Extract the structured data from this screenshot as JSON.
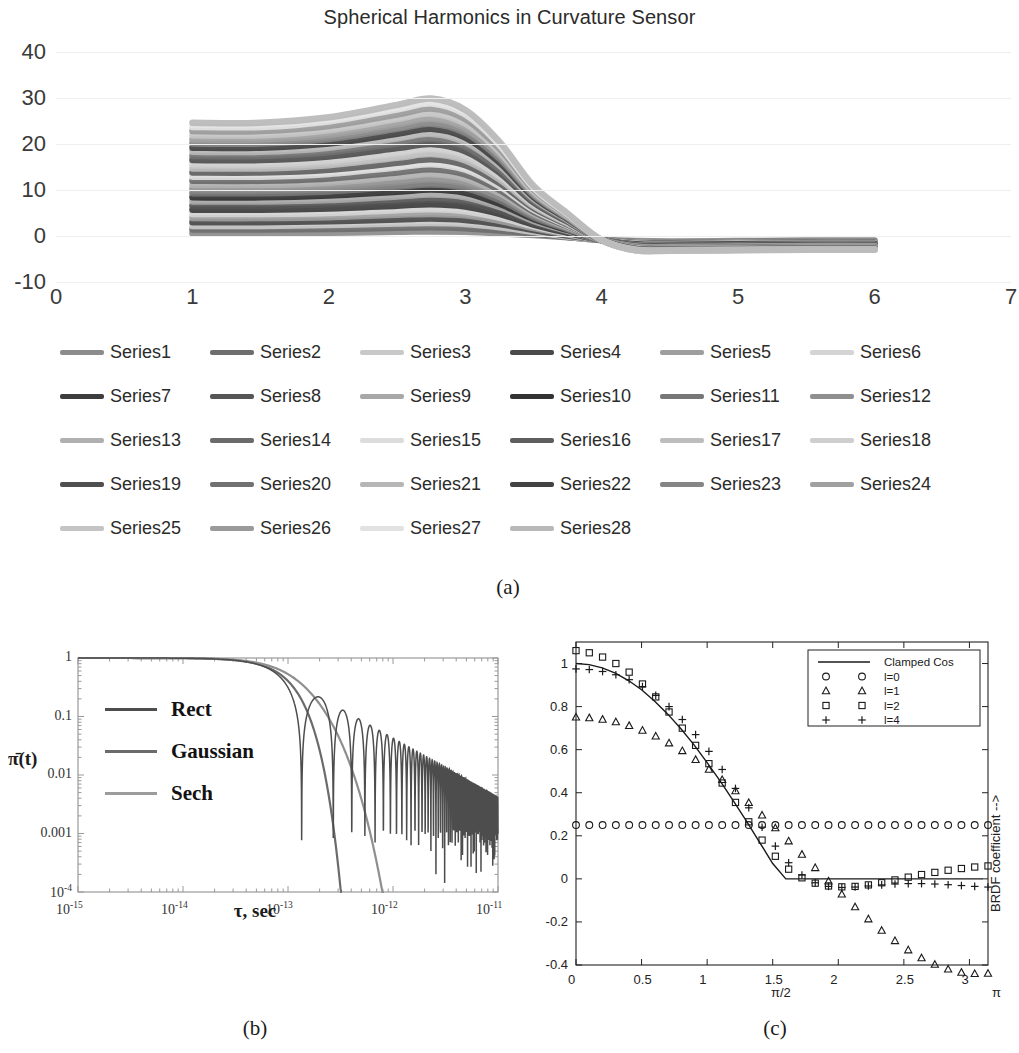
{
  "figure": {
    "captions": {
      "a": "(a)",
      "b": "(b)",
      "c": "(c)"
    }
  },
  "panel_a": {
    "title": "Spherical Harmonics in Curvature Sensor"
  },
  "panel_b": {
    "ylabel": "π̄(t)",
    "xlabel": "τ, sec",
    "legend": [
      "Rect",
      "Gaussian",
      "Sech"
    ],
    "yticks": [
      "1",
      "0.1",
      "0.01",
      "0.001",
      "10⁻⁴"
    ],
    "xticks": [
      "10⁻¹⁵",
      "10⁻¹⁴",
      "10⁻¹³",
      "10⁻¹²",
      "10⁻¹¹"
    ]
  },
  "panel_c": {
    "right_label": "BRDF coefficient -->",
    "legend": [
      "Clamped Cos",
      "l=0",
      "l=1",
      "l=2",
      "l=4"
    ],
    "xticks": [
      "0",
      "0.5",
      "1",
      "1.5",
      "2",
      "2.5",
      "3"
    ],
    "yticks": [
      "1",
      "0.8",
      "0.6",
      "0.4",
      "0.2",
      "0",
      "-0.2",
      "-0.4"
    ],
    "annotations": {
      "half_pi": "π/2",
      "pi": "π"
    }
  },
  "chart_data": [
    {
      "id": "a",
      "type": "line",
      "title": "Spherical Harmonics in Curvature Sensor",
      "xlabel": "",
      "ylabel": "",
      "xlim": [
        0,
        7
      ],
      "ylim": [
        -10,
        40
      ],
      "xticks": [
        0,
        1,
        2,
        3,
        4,
        5,
        6,
        7
      ],
      "yticks": [
        -10,
        0,
        10,
        20,
        30,
        40
      ],
      "grid": true,
      "legend_position": "bottom",
      "x": [
        1,
        1.5,
        2,
        2.5,
        2.75,
        3,
        3.25,
        3.5,
        3.75,
        4,
        4.25,
        4.5,
        5,
        5.5,
        6
      ],
      "series": [
        {
          "name": "Series1",
          "color": "#8c8c8c",
          "values": [
            0.6,
            0.6,
            0.7,
            0.9,
            1.0,
            0.9,
            0.6,
            0.2,
            -0.3,
            -0.8,
            -1.1,
            -1.2,
            -1.1,
            -1.0,
            -1.0
          ]
        },
        {
          "name": "Series2",
          "color": "#6e6e6e",
          "values": [
            1.4,
            1.4,
            1.5,
            1.8,
            1.9,
            1.7,
            1.2,
            0.5,
            -0.2,
            -0.9,
            -1.3,
            -1.4,
            -1.3,
            -1.2,
            -1.2
          ]
        },
        {
          "name": "Series3",
          "color": "#c9c9c9",
          "values": [
            2.2,
            2.2,
            2.4,
            2.7,
            2.8,
            2.6,
            1.9,
            0.9,
            -0.1,
            -0.9,
            -1.4,
            -1.5,
            -1.4,
            -1.3,
            -1.3
          ]
        },
        {
          "name": "Series4",
          "color": "#4a4a4a",
          "values": [
            3.0,
            3.0,
            3.2,
            3.6,
            3.8,
            3.5,
            2.6,
            1.3,
            0.1,
            -0.9,
            -1.5,
            -1.6,
            -1.5,
            -1.4,
            -1.4
          ]
        },
        {
          "name": "Series5",
          "color": "#9e9e9e",
          "values": [
            3.9,
            3.9,
            4.1,
            4.6,
            4.8,
            4.5,
            3.3,
            1.7,
            0.3,
            -0.9,
            -1.6,
            -1.7,
            -1.6,
            -1.5,
            -1.5
          ]
        },
        {
          "name": "Series6",
          "color": "#d4d4d4",
          "values": [
            4.8,
            4.8,
            5.0,
            5.6,
            5.8,
            5.4,
            4.0,
            2.1,
            0.5,
            -0.9,
            -1.7,
            -1.8,
            -1.7,
            -1.6,
            -1.6
          ]
        },
        {
          "name": "Series7",
          "color": "#3d3d3d",
          "values": [
            5.7,
            5.7,
            6.0,
            6.6,
            6.9,
            6.4,
            4.8,
            2.5,
            0.7,
            -0.9,
            -1.8,
            -1.9,
            -1.8,
            -1.7,
            -1.7
          ]
        },
        {
          "name": "Series8",
          "color": "#555555",
          "values": [
            6.6,
            6.6,
            6.9,
            7.6,
            7.9,
            7.4,
            5.5,
            2.9,
            0.9,
            -0.9,
            -1.9,
            -2.0,
            -1.9,
            -1.8,
            -1.8
          ]
        },
        {
          "name": "Series9",
          "color": "#a8a8a8",
          "values": [
            7.5,
            7.5,
            7.8,
            8.6,
            9.0,
            8.4,
            6.3,
            3.3,
            1.1,
            -0.9,
            -2.0,
            -2.1,
            -2.0,
            -1.9,
            -1.9
          ]
        },
        {
          "name": "Series10",
          "color": "#333333",
          "values": [
            8.4,
            8.4,
            8.8,
            9.6,
            10.1,
            9.4,
            7.0,
            3.7,
            1.3,
            -0.9,
            -2.1,
            -2.2,
            -2.1,
            -2.0,
            -2.0
          ]
        },
        {
          "name": "Series11",
          "color": "#777777",
          "values": [
            9.3,
            9.3,
            9.7,
            10.7,
            11.2,
            10.4,
            7.8,
            4.1,
            1.5,
            -0.9,
            -2.2,
            -2.3,
            -2.2,
            -2.1,
            -2.1
          ]
        },
        {
          "name": "Series12",
          "color": "#8f8f8f",
          "values": [
            10.2,
            10.2,
            10.6,
            11.7,
            12.3,
            11.4,
            8.5,
            4.5,
            1.7,
            -0.9,
            -2.3,
            -2.4,
            -2.3,
            -2.2,
            -2.2
          ]
        },
        {
          "name": "Series13",
          "color": "#b0b0b0",
          "values": [
            11.1,
            11.1,
            11.6,
            12.8,
            13.4,
            12.4,
            9.3,
            4.9,
            1.9,
            -0.9,
            -2.4,
            -2.5,
            -2.4,
            -2.3,
            -2.3
          ]
        },
        {
          "name": "Series14",
          "color": "#6b6b6b",
          "values": [
            12.0,
            12.0,
            12.5,
            13.8,
            14.5,
            13.4,
            10.0,
            5.3,
            2.1,
            -0.9,
            -2.5,
            -2.6,
            -2.5,
            -2.4,
            -2.4
          ]
        },
        {
          "name": "Series15",
          "color": "#dcdcdc",
          "values": [
            12.9,
            12.9,
            13.5,
            14.9,
            15.6,
            14.4,
            10.8,
            5.7,
            2.3,
            -0.9,
            -2.6,
            -2.7,
            -2.6,
            -2.5,
            -2.5
          ]
        },
        {
          "name": "Series16",
          "color": "#5f5f5f",
          "values": [
            13.8,
            13.8,
            14.4,
            15.9,
            16.7,
            15.4,
            11.5,
            6.1,
            2.5,
            -0.9,
            -2.6,
            -2.7,
            -2.6,
            -2.5,
            -2.5
          ]
        },
        {
          "name": "Series17",
          "color": "#bdbdbd",
          "values": [
            14.7,
            14.7,
            15.4,
            17.0,
            17.8,
            16.4,
            12.3,
            6.5,
            2.7,
            -0.9,
            -2.7,
            -2.8,
            -2.7,
            -2.6,
            -2.6
          ]
        },
        {
          "name": "Series18",
          "color": "#cfcfcf",
          "values": [
            15.6,
            15.6,
            16.3,
            18.0,
            18.9,
            17.4,
            13.0,
            6.9,
            2.9,
            -0.9,
            -2.7,
            -2.8,
            -2.7,
            -2.6,
            -2.6
          ]
        },
        {
          "name": "Series19",
          "color": "#4f4f4f",
          "values": [
            16.5,
            16.5,
            17.3,
            19.1,
            20.0,
            18.4,
            13.8,
            7.3,
            3.1,
            -0.9,
            -2.8,
            -2.9,
            -2.8,
            -2.7,
            -2.7
          ]
        },
        {
          "name": "Series20",
          "color": "#717171",
          "values": [
            17.4,
            17.4,
            18.2,
            20.1,
            21.1,
            19.4,
            14.5,
            7.7,
            3.3,
            -0.9,
            -2.8,
            -2.9,
            -2.8,
            -2.7,
            -2.7
          ]
        },
        {
          "name": "Series21",
          "color": "#b6b6b6",
          "values": [
            18.3,
            18.3,
            19.2,
            21.2,
            22.2,
            20.4,
            15.3,
            8.1,
            3.5,
            -0.9,
            -2.9,
            -3.0,
            -2.9,
            -2.8,
            -2.8
          ]
        },
        {
          "name": "Series22",
          "color": "#424242",
          "values": [
            19.2,
            19.2,
            20.1,
            22.2,
            23.3,
            21.4,
            16.0,
            8.5,
            3.7,
            -0.9,
            -2.9,
            -3.0,
            -2.9,
            -2.8,
            -2.8
          ]
        },
        {
          "name": "Series23",
          "color": "#858585",
          "values": [
            20.1,
            20.1,
            21.1,
            23.3,
            24.4,
            22.4,
            16.8,
            8.9,
            3.9,
            -0.9,
            -3.0,
            -3.0,
            -2.9,
            -2.8,
            -2.8
          ]
        },
        {
          "name": "Series24",
          "color": "#a0a0a0",
          "values": [
            21.0,
            21.0,
            22.0,
            24.3,
            25.5,
            23.4,
            17.5,
            9.3,
            4.1,
            -0.9,
            -3.0,
            -3.1,
            -3.0,
            -2.9,
            -2.9
          ]
        },
        {
          "name": "Series25",
          "color": "#c4c4c4",
          "values": [
            21.9,
            21.9,
            23.0,
            25.4,
            26.6,
            24.4,
            18.3,
            9.7,
            4.3,
            -0.9,
            -3.0,
            -3.1,
            -3.0,
            -2.9,
            -2.9
          ]
        },
        {
          "name": "Series26",
          "color": "#9a9a9a",
          "values": [
            22.8,
            22.8,
            23.9,
            26.4,
            27.7,
            25.4,
            19.0,
            10.1,
            4.5,
            -0.9,
            -3.1,
            -3.1,
            -3.0,
            -2.9,
            -2.9
          ]
        },
        {
          "name": "Series27",
          "color": "#e2e2e2",
          "values": [
            23.7,
            23.7,
            24.9,
            27.5,
            28.8,
            26.4,
            19.8,
            10.5,
            4.7,
            -0.9,
            -3.1,
            -3.2,
            -3.1,
            -3.0,
            -3.0
          ]
        },
        {
          "name": "Series28",
          "color": "#b9b9b9",
          "values": [
            24.6,
            24.6,
            25.8,
            28.5,
            29.9,
            27.4,
            20.5,
            10.9,
            4.9,
            -0.9,
            -3.1,
            -3.2,
            -3.1,
            -3.0,
            -3.0
          ]
        }
      ]
    },
    {
      "id": "b",
      "type": "line",
      "title": "",
      "xlabel": "τ, sec",
      "ylabel": "π̄(t)",
      "xscale": "log",
      "yscale": "log",
      "xlim": [
        1e-15,
        1e-11
      ],
      "ylim": [
        0.0001,
        1
      ],
      "xticks": [
        1e-15,
        1e-14,
        1e-13,
        1e-12,
        1e-11
      ],
      "yticks": [
        1,
        0.1,
        0.01,
        0.001,
        0.0001
      ],
      "grid": false,
      "legend_position": "left-inside",
      "series": [
        {
          "name": "Rect",
          "color": "#4d4d4d",
          "note": "sinc-like, oscillatory decay with deep nulls after 2e-13"
        },
        {
          "name": "Gaussian",
          "color": "#6b6b6b",
          "note": "smooth monotonic roll-off, no oscillation"
        },
        {
          "name": "Sech",
          "color": "#8c8c8c",
          "note": "smooth roll-off, slightly slower than Gaussian"
        }
      ]
    },
    {
      "id": "c",
      "type": "scatter",
      "title": "",
      "xlabel": "",
      "ylabel": "BRDF coefficient -->",
      "xlim": [
        0,
        3.14159
      ],
      "ylim": [
        -0.4,
        1.1
      ],
      "xticks": [
        0,
        0.5,
        1,
        1.5,
        2,
        2.5,
        3
      ],
      "yticks": [
        -0.4,
        -0.2,
        0,
        0.2,
        0.4,
        0.6,
        0.8,
        1
      ],
      "grid": false,
      "legend_position": "top-right",
      "x": [
        0,
        0.1,
        0.2,
        0.3,
        0.4,
        0.5,
        0.6,
        0.7,
        0.8,
        0.9,
        1.0,
        1.1,
        1.2,
        1.3,
        1.4,
        1.5,
        1.6,
        1.7,
        1.8,
        1.9,
        2.0,
        2.1,
        2.2,
        2.3,
        2.4,
        2.5,
        2.6,
        2.7,
        2.8,
        2.9,
        3.0,
        3.1
      ],
      "series": [
        {
          "name": "Clamped Cos",
          "marker": "line",
          "color": "#1a1a1a",
          "values": [
            1.0,
            0.995,
            0.98,
            0.955,
            0.921,
            0.878,
            0.825,
            0.765,
            0.697,
            0.622,
            0.54,
            0.454,
            0.362,
            0.268,
            0.17,
            0.071,
            0,
            0,
            0,
            0,
            0,
            0,
            0,
            0,
            0,
            0,
            0,
            0,
            0,
            0,
            0,
            0
          ]
        },
        {
          "name": "l=0",
          "marker": "circle",
          "color": "#1a1a1a",
          "values": [
            0.25,
            0.25,
            0.25,
            0.25,
            0.25,
            0.25,
            0.25,
            0.25,
            0.25,
            0.25,
            0.25,
            0.25,
            0.25,
            0.25,
            0.25,
            0.25,
            0.25,
            0.25,
            0.25,
            0.25,
            0.25,
            0.25,
            0.25,
            0.25,
            0.25,
            0.25,
            0.25,
            0.25,
            0.25,
            0.25,
            0.25,
            0.25
          ]
        },
        {
          "name": "l=1",
          "marker": "triangle",
          "color": "#1a1a1a",
          "values": [
            0.75,
            0.747,
            0.74,
            0.728,
            0.711,
            0.689,
            0.662,
            0.63,
            0.594,
            0.553,
            0.508,
            0.46,
            0.408,
            0.353,
            0.295,
            0.236,
            0.175,
            0.113,
            0.051,
            -0.011,
            -0.072,
            -0.131,
            -0.187,
            -0.24,
            -0.288,
            -0.331,
            -0.368,
            -0.398,
            -0.42,
            -0.435,
            -0.441,
            -0.44
          ]
        },
        {
          "name": "l=2",
          "marker": "square",
          "color": "#1a1a1a",
          "values": [
            1.06,
            1.05,
            1.03,
            1.0,
            0.96,
            0.905,
            0.845,
            0.775,
            0.7,
            0.62,
            0.535,
            0.445,
            0.355,
            0.265,
            0.18,
            0.105,
            0.045,
            0.005,
            -0.02,
            -0.033,
            -0.037,
            -0.035,
            -0.028,
            -0.018,
            -0.005,
            0.008,
            0.02,
            0.03,
            0.04,
            0.048,
            0.055,
            0.06
          ]
        },
        {
          "name": "l=4",
          "marker": "plus",
          "color": "#1a1a1a",
          "values": [
            0.975,
            0.972,
            0.963,
            0.948,
            0.925,
            0.893,
            0.852,
            0.8,
            0.74,
            0.67,
            0.592,
            0.508,
            0.42,
            0.33,
            0.24,
            0.152,
            0.075,
            0.018,
            -0.018,
            -0.035,
            -0.04,
            -0.038,
            -0.033,
            -0.028,
            -0.024,
            -0.022,
            -0.022,
            -0.024,
            -0.027,
            -0.031,
            -0.035,
            -0.038
          ]
        }
      ]
    }
  ]
}
